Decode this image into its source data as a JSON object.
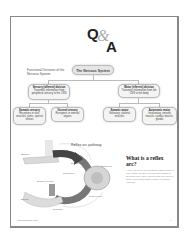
{
  "header": {
    "q": "Q",
    "amp": "&",
    "a": "A"
  },
  "flowchart": {
    "label": "Functional Divisions of the Nervous System",
    "root": "The Nervous System",
    "level1": [
      {
        "title": "Sensory (afferent) division",
        "body": "Transmits information from peripheral sensory to the CNS"
      },
      {
        "title": "Motor (efferent) division",
        "body": "Transmits information from the CNS to the body"
      }
    ],
    "level2": [
      {
        "title": "Somatic sensory",
        "body": "Receptors in skin, muscles, joints, special senses"
      },
      {
        "title": "Visceral sensory",
        "body": "Receptors in internal organs"
      },
      {
        "title": "Somatic motor",
        "body": "Voluntary; skeletal muscles"
      },
      {
        "title": "Autonomic motor",
        "body": "Involuntary; smooth muscle, cardiac muscle, glands"
      }
    ]
  },
  "illustration": {
    "title": "Reflex arc pathway",
    "labels": [
      "Stimulus",
      "Sensory receptor",
      "Sensory neuron",
      "Interneuron",
      "Spinal cord",
      "Motor neuron",
      "Effector",
      "Response"
    ]
  },
  "sidebar": {
    "heading": "What is a reflex arc?",
    "body": "A reflex arc is the neural pathway that mediates a reflex action. Sensory neurons carry signals to the spinal cord, where interneurons relay them to motor neurons that trigger a rapid, involuntary response."
  },
  "footer": {
    "source": "Medical Exam Prep",
    "page": "1"
  }
}
